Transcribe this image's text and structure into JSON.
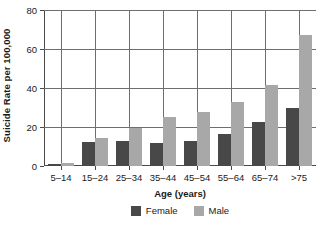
{
  "chart_data": {
    "type": "bar",
    "title": "",
    "xlabel": "Age (years)",
    "ylabel": "Suicide Rate per 100,000",
    "categories": [
      "5–14",
      "15–24",
      "25–34",
      "35–44",
      "45–54",
      "55–64",
      "65–74",
      ">75"
    ],
    "series": [
      {
        "name": "Female",
        "color": "#484848",
        "values": [
          1,
          12.5,
          13,
          12,
          13,
          16.5,
          22.5,
          30
        ]
      },
      {
        "name": "Male",
        "color": "#a8a8a8",
        "values": [
          1.5,
          14.5,
          19.5,
          25,
          27.5,
          33,
          41.5,
          67
        ]
      }
    ],
    "ylim": [
      0,
      80
    ],
    "yticks": [
      0,
      20,
      40,
      60,
      80
    ],
    "ytick_labels": [
      "0",
      "20",
      "40",
      "60",
      "80"
    ],
    "grid": "horizontal-and-group-separators",
    "legend_position": "bottom-center"
  }
}
